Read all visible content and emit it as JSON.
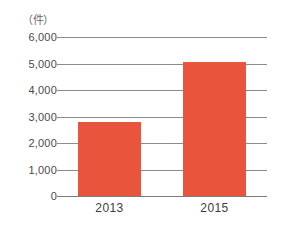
{
  "chart_data": {
    "type": "bar",
    "title": "",
    "xlabel": "",
    "ylabel": "（件）",
    "unit_label": "（件）",
    "categories": [
      "2013",
      "2015"
    ],
    "values": [
      2800,
      5050
    ],
    "series": [
      {
        "name": "件数",
        "values": [
          2800,
          5050
        ]
      }
    ],
    "ylim": [
      0,
      6000
    ],
    "ytick_values": [
      6000,
      5000,
      4000,
      3000,
      2000,
      1000,
      0
    ],
    "ytick_labels": [
      "6,000",
      "5,000",
      "4,000",
      "3,000",
      "2,000",
      "1,000",
      "0"
    ],
    "grid": true,
    "legend": false,
    "legend_position": "none",
    "bar_color": "#e8553c",
    "gridline_color": "#8c8c8c",
    "background_color": "#ffffff"
  }
}
